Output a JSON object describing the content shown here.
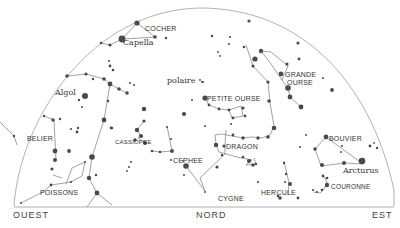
{
  "chart": {
    "title": "",
    "colors": {
      "ink": "#4a4a4a",
      "line": "#8a8a8a",
      "horizon": "#999999"
    },
    "directions": {
      "west": "OUEST",
      "north": "NORD",
      "east": "EST"
    },
    "constellations": {
      "cocher": "COCHER",
      "capella": "Capella",
      "polaire": "polaire",
      "algol": "Algol",
      "grande_ourse": "GRANDE OURSE",
      "grande_ourse_line1": "GRANDE",
      "grande_ourse_line2": "OURSE",
      "petite_ourse": "PETITE OURSE",
      "belier": "BELIER",
      "cassiopee": "CASSIOPEE",
      "cephee": "CEPHEE",
      "dragon": "DRAGON",
      "bouvier": "BOUVIER",
      "arcturus": "Arcturus",
      "poissons": "POISSONS",
      "cygne": "CYGNE",
      "hercule": "HERCULE",
      "couronne": "COURONNE"
    }
  }
}
